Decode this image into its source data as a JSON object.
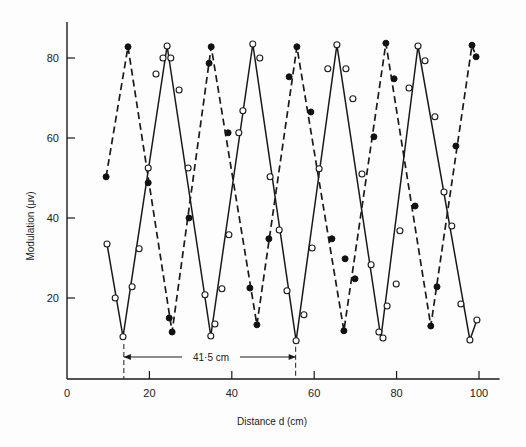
{
  "chart_data": {
    "type": "line",
    "title": "",
    "xlabel": "Distance d (cm)",
    "ylabel": "Modulation (μv)",
    "xlim": [
      0,
      105
    ],
    "ylim": [
      0,
      90
    ],
    "xticks": [
      0,
      20,
      40,
      60,
      80,
      100
    ],
    "yticks": [
      20,
      40,
      60,
      80
    ],
    "grid": false,
    "legend": null,
    "annotation": {
      "text": "41·5 cm",
      "from_x": 13.8,
      "to_x": 55.5,
      "y": 10
    },
    "series": [
      {
        "name": "open-circles-solid",
        "marker": "open-circle",
        "line": "solid",
        "points": [
          [
            9.7,
            33.5
          ],
          [
            11.7,
            20.0
          ],
          [
            13.6,
            10.3
          ],
          [
            15.8,
            22.8
          ],
          [
            17.5,
            32.3
          ],
          [
            19.7,
            52.5
          ],
          [
            21.6,
            76.0
          ],
          [
            23.3,
            80.0
          ],
          [
            24.3,
            83.0
          ],
          [
            25.2,
            80.0
          ],
          [
            27.2,
            72.0
          ],
          [
            29.4,
            52.5
          ],
          [
            33.5,
            20.8
          ],
          [
            34.9,
            10.5
          ],
          [
            35.9,
            13.5
          ],
          [
            37.6,
            22.3
          ],
          [
            39.3,
            35.8
          ],
          [
            41.7,
            61.3
          ],
          [
            42.7,
            66.8
          ],
          [
            45.1,
            83.5
          ],
          [
            46.8,
            80.0
          ],
          [
            49.3,
            50.3
          ],
          [
            51.5,
            37.0
          ],
          [
            53.4,
            21.8
          ],
          [
            55.6,
            9.3
          ],
          [
            57.5,
            15.8
          ],
          [
            59.5,
            32.5
          ],
          [
            61.2,
            52.3
          ],
          [
            63.3,
            77.3
          ],
          [
            65.5,
            83.3
          ],
          [
            67.7,
            77.3
          ],
          [
            69.4,
            69.8
          ],
          [
            71.6,
            51.0
          ],
          [
            73.8,
            28.3
          ],
          [
            75.7,
            11.5
          ],
          [
            76.7,
            10.0
          ],
          [
            77.7,
            18.0
          ],
          [
            79.9,
            23.5
          ],
          [
            80.8,
            36.8
          ],
          [
            83.0,
            72.5
          ],
          [
            85.2,
            83.0
          ],
          [
            86.9,
            79.3
          ],
          [
            89.3,
            65.3
          ],
          [
            91.5,
            46.5
          ],
          [
            93.4,
            38.0
          ],
          [
            95.6,
            18.5
          ],
          [
            97.8,
            9.5
          ],
          [
            99.5,
            14.5
          ]
        ],
        "line_path": [
          [
            9.7,
            33.5
          ],
          [
            13.6,
            10.3
          ],
          [
            24.3,
            83.0
          ],
          [
            34.9,
            10.5
          ],
          [
            45.1,
            83.5
          ],
          [
            55.6,
            9.3
          ],
          [
            65.5,
            83.3
          ],
          [
            76.2,
            10.0
          ],
          [
            85.2,
            83.0
          ],
          [
            97.8,
            9.5
          ],
          [
            99.5,
            14.5
          ]
        ]
      },
      {
        "name": "filled-circles-dashed",
        "marker": "filled-circle",
        "line": "dashed",
        "points": [
          [
            9.5,
            50.3
          ],
          [
            14.8,
            82.8
          ],
          [
            19.7,
            48.8
          ],
          [
            24.8,
            15.0
          ],
          [
            25.5,
            11.5
          ],
          [
            29.6,
            40.0
          ],
          [
            34.5,
            78.7
          ],
          [
            35.0,
            82.8
          ],
          [
            39.1,
            61.3
          ],
          [
            44.4,
            22.5
          ],
          [
            46.1,
            13.3
          ],
          [
            49.0,
            34.8
          ],
          [
            53.9,
            75.3
          ],
          [
            55.8,
            82.8
          ],
          [
            59.2,
            66.5
          ],
          [
            64.3,
            34.8
          ],
          [
            67.2,
            11.8
          ],
          [
            67.5,
            29.8
          ],
          [
            69.9,
            24.8
          ],
          [
            74.5,
            60.3
          ],
          [
            77.4,
            83.7
          ],
          [
            79.4,
            74.8
          ],
          [
            84.5,
            43.0
          ],
          [
            88.3,
            13.0
          ],
          [
            89.8,
            22.8
          ],
          [
            94.4,
            58.0
          ],
          [
            98.3,
            83.2
          ],
          [
            99.3,
            80.3
          ]
        ],
        "line_path": [
          [
            9.5,
            50.3
          ],
          [
            14.8,
            82.8
          ],
          [
            25.5,
            11.5
          ],
          [
            35.0,
            82.8
          ],
          [
            46.1,
            13.3
          ],
          [
            55.8,
            82.8
          ],
          [
            67.2,
            11.8
          ],
          [
            77.4,
            83.7
          ],
          [
            88.3,
            13.0
          ],
          [
            98.3,
            83.2
          ],
          [
            99.3,
            80.3
          ]
        ]
      }
    ]
  },
  "axes": {
    "x_title": "Distance d (cm)",
    "y_title": "Modulation (μv)",
    "x_tick_labels": [
      "0",
      "20",
      "40",
      "60",
      "80",
      "100"
    ],
    "y_tick_labels": [
      "20",
      "40",
      "60",
      "80"
    ]
  },
  "annotation": {
    "label": "41·5 cm"
  }
}
